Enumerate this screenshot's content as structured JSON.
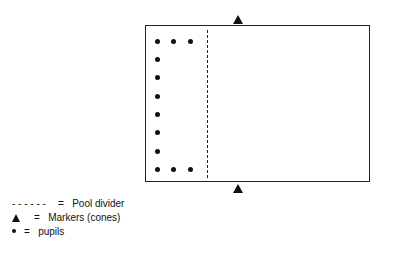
{
  "diagram": {
    "pool": {
      "label": "pool"
    },
    "markers": [
      {
        "position": "top"
      },
      {
        "position": "bottom"
      }
    ],
    "pupils": {
      "top_row": 3,
      "left_column": 6,
      "bottom_row": 3
    }
  },
  "legend": {
    "items": [
      {
        "symbol": "- - - - - -",
        "equals": "=",
        "label": "Pool divider"
      },
      {
        "symbol": "triangle",
        "equals": "=",
        "label": "Markers (cones)"
      },
      {
        "symbol": "dot",
        "equals": "=",
        "label": "pupils"
      }
    ]
  }
}
